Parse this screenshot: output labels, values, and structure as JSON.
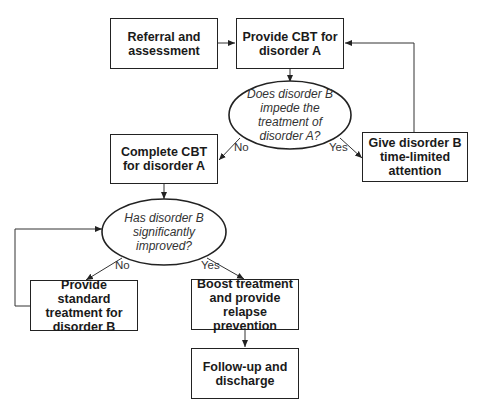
{
  "nodes": {
    "referral": {
      "label": "Referral and assessment",
      "type": "process"
    },
    "provide_cbt": {
      "label": "Provide CBT for disorder A",
      "type": "process"
    },
    "decision_impede": {
      "label": "Does disorder B impede the treatment of disorder A?",
      "type": "decision"
    },
    "give_attention": {
      "label": "Give disorder B time-limited attention",
      "type": "process"
    },
    "complete_cbt": {
      "label": "Complete CBT for disorder A",
      "type": "process"
    },
    "decision_improved": {
      "label": "Has disorder B significantly improved?",
      "type": "decision"
    },
    "standard_treatment": {
      "label": "Provide standard treatment for disorder B",
      "type": "process"
    },
    "boost_treatment": {
      "label": "Boost treatment and provide relapse prevention",
      "type": "process"
    },
    "follow_up": {
      "label": "Follow-up and discharge",
      "type": "process"
    }
  },
  "edges": {
    "impede_no": {
      "from": "decision_impede",
      "to": "complete_cbt",
      "label": "No"
    },
    "impede_yes": {
      "from": "decision_impede",
      "to": "give_attention",
      "label": "Yes"
    },
    "improved_no": {
      "from": "decision_improved",
      "to": "standard_treatment",
      "label": "No"
    },
    "improved_yes": {
      "from": "decision_improved",
      "to": "boost_treatment",
      "label": "Yes"
    }
  },
  "colors": {
    "stroke": "#222222",
    "text": "#1a1a1a",
    "background": "#ffffff"
  }
}
